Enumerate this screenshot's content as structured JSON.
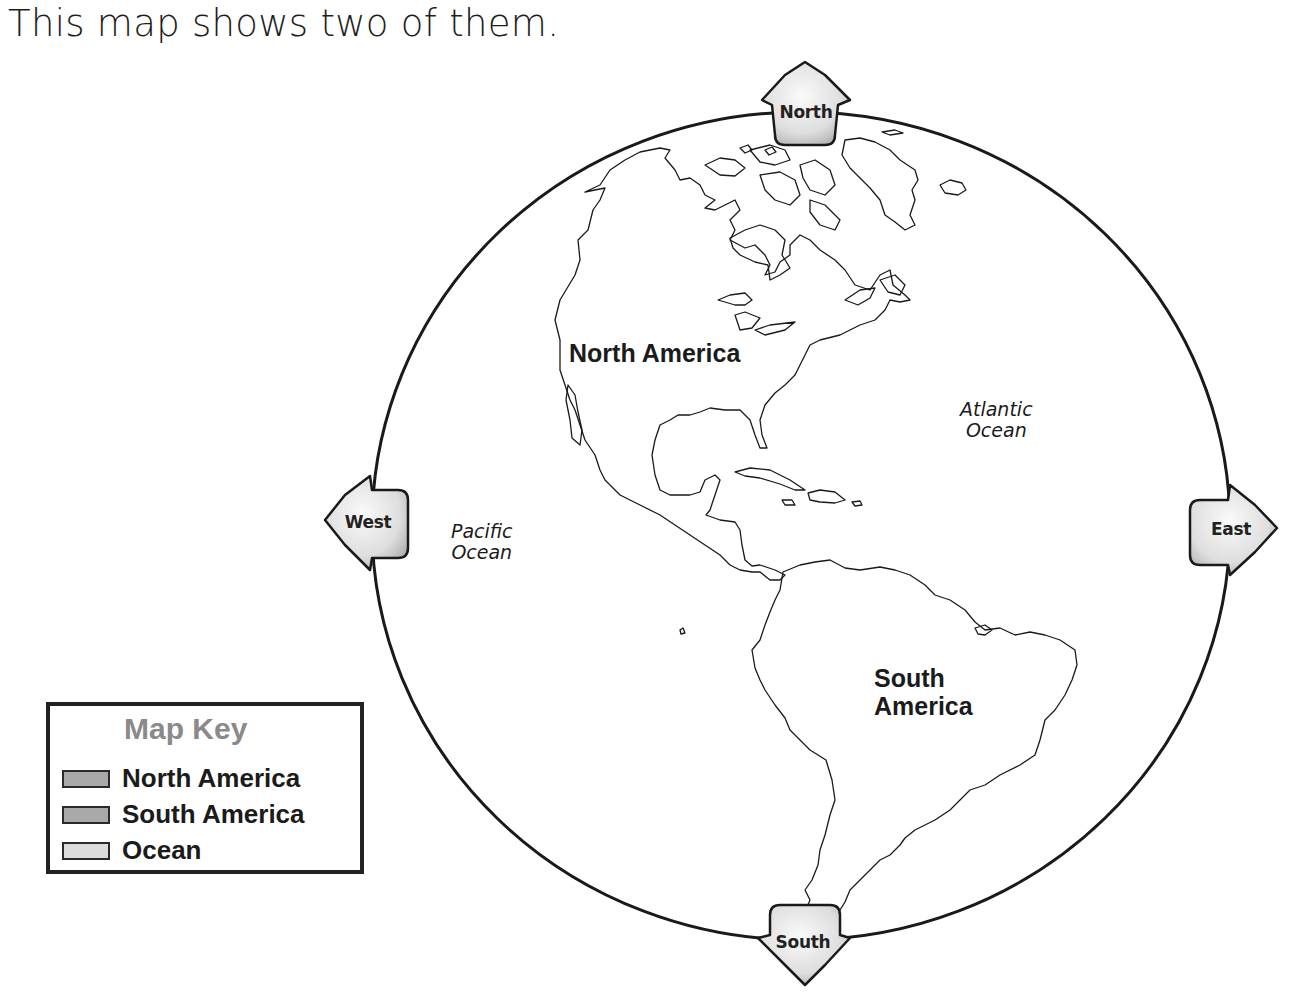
{
  "caption": "This map shows two of them.",
  "map": {
    "continents": [
      {
        "name": "North America",
        "label": "North America"
      },
      {
        "name": "South America",
        "label_line1": "South",
        "label_line2": "America"
      }
    ],
    "oceans": [
      {
        "name": "Atlantic Ocean",
        "line1": "Atlantic",
        "line2": "Ocean"
      },
      {
        "name": "Pacific Ocean",
        "line1": "Pacific",
        "line2": "Ocean"
      }
    ],
    "compass": {
      "north": "North",
      "south": "South",
      "east": "East",
      "west": "West"
    }
  },
  "legend": {
    "title": "Map Key",
    "items": [
      {
        "label": "North America",
        "color": "#a9a9a9"
      },
      {
        "label": "South America",
        "color": "#a9a9a9"
      },
      {
        "label": "Ocean",
        "color": "#dcdcdc"
      }
    ]
  },
  "colors": {
    "outline": "#1a1a1a",
    "compass_fill_light": "#f7f7f7",
    "compass_fill_dark": "#bdbdbd",
    "legend_title": "#8a8a8a"
  }
}
